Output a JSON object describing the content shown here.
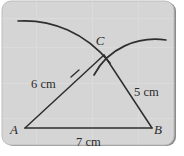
{
  "figure": {
    "panel": {
      "background_color": "#d5d5d5",
      "border_color": "#6b6b6b",
      "page_background": "#ffffff"
    },
    "stroke_color": "#2e2e2e",
    "vertices": [
      {
        "id": "A",
        "label": "A",
        "x": 25,
        "y": 128,
        "label_x": 14,
        "label_y": 134
      },
      {
        "id": "B",
        "label": "B",
        "x": 152,
        "y": 128,
        "label_x": 158,
        "label_y": 134
      },
      {
        "id": "C",
        "label": "C",
        "x": 104,
        "y": 55,
        "label_x": 100,
        "label_y": 45
      }
    ],
    "sides": [
      {
        "id": "AC",
        "from": "A",
        "to": "C",
        "measure": "6 cm",
        "label_x": 31,
        "label_y": 88
      },
      {
        "id": "BC",
        "from": "C",
        "to": "B",
        "measure": "5 cm",
        "label_x": 134,
        "label_y": 96
      },
      {
        "id": "AB",
        "from": "A",
        "to": "B",
        "measure": "7 cm",
        "label_x": 76,
        "label_y": 146
      }
    ],
    "arcs": [
      {
        "id": "arc-from-A",
        "center": "A",
        "path": "M 18 21 C 52 19 86 33 110 63",
        "description": "compass arc of radius 6 cm swung from vertex A"
      },
      {
        "id": "arc-from-B",
        "center": "B",
        "path": "M 94 75 C 108 48 138 36 166 40",
        "description": "compass arc of radius 5 cm swung from vertex B"
      }
    ],
    "tick": {
      "id": "tick-AC",
      "path": "M 71 77 L 79 70",
      "description": "construction tick mark on side AC"
    }
  }
}
